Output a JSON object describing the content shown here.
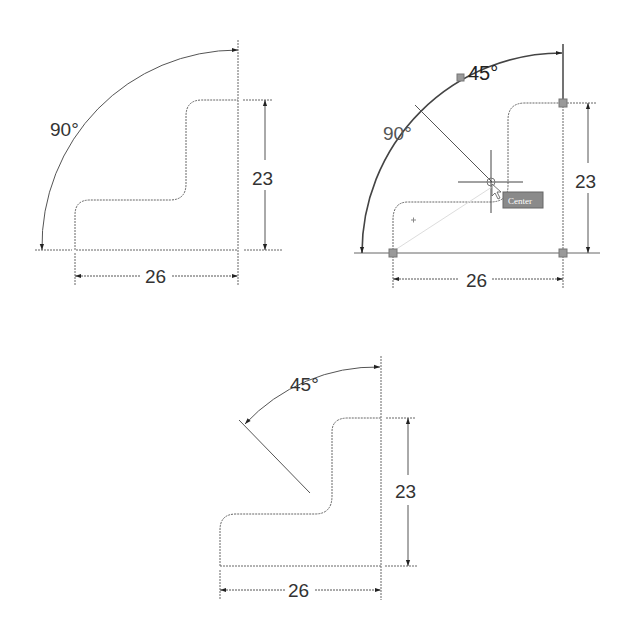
{
  "figures": [
    {
      "id": "fig1",
      "state": "initial",
      "angle_label": "90°",
      "height_label": "23",
      "width_label": "26"
    },
    {
      "id": "fig2",
      "state": "editing",
      "angle_label_old": "90°",
      "angle_label_new": "45°",
      "height_label": "23",
      "width_label": "26",
      "tooltip": "Center"
    },
    {
      "id": "fig3",
      "state": "result",
      "angle_label": "45°",
      "height_label": "23",
      "width_label": "26"
    }
  ],
  "colors": {
    "line": "#555555",
    "text": "#333333",
    "grip": "#888888",
    "tooltip_bg": "#8a8a8a"
  }
}
